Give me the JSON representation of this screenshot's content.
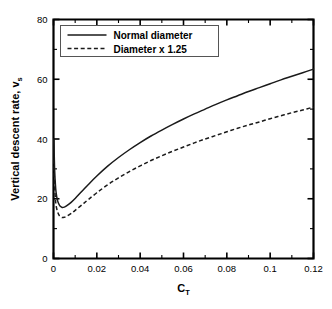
{
  "chart_data": {
    "type": "line",
    "title": "",
    "xlabel": "C_T",
    "xlabel_base": "C",
    "xlabel_sub": "T",
    "ylabel": "Vertical descent rate, v_s",
    "ylabel_base": "Vertical descent rate, v",
    "ylabel_sub": "s",
    "xlim": [
      0,
      0.12
    ],
    "ylim": [
      0,
      80
    ],
    "grid": false,
    "legend_position": "upper-left-inside",
    "x_ticks": [
      {
        "value": 0,
        "label": "0"
      },
      {
        "value": 0.02,
        "label": "0.02"
      },
      {
        "value": 0.04,
        "label": "0.04"
      },
      {
        "value": 0.06,
        "label": "0.06"
      },
      {
        "value": 0.08,
        "label": "0.08"
      },
      {
        "value": 0.1,
        "label": "0.1"
      },
      {
        "value": 0.12,
        "label": "0.12"
      }
    ],
    "x_minor_ticks": [
      0.01,
      0.03,
      0.05,
      0.07,
      0.09,
      0.11
    ],
    "y_ticks": [
      {
        "value": 0,
        "label": "0"
      },
      {
        "value": 20,
        "label": "20"
      },
      {
        "value": 40,
        "label": "40"
      },
      {
        "value": 60,
        "label": "60"
      },
      {
        "value": 80,
        "label": "80"
      }
    ],
    "y_minor_ticks": [
      10,
      30,
      50,
      70
    ],
    "series": [
      {
        "name": "Normal diameter",
        "style": "solid",
        "color": "#1a1a1a",
        "x": [
          0.0002,
          0.0005,
          0.001,
          0.0015,
          0.002,
          0.0025,
          0.003,
          0.004,
          0.005,
          0.006,
          0.008,
          0.01,
          0.013,
          0.016,
          0.02,
          0.025,
          0.03,
          0.035,
          0.04,
          0.045,
          0.05,
          0.055,
          0.06,
          0.065,
          0.07,
          0.075,
          0.08,
          0.085,
          0.09,
          0.095,
          0.1,
          0.105,
          0.11,
          0.115,
          0.12
        ],
        "y": [
          40.0,
          30.0,
          23.5,
          20.6,
          19.1,
          18.2,
          17.6,
          17.1,
          17.2,
          17.6,
          18.7,
          20.1,
          22.4,
          24.7,
          27.6,
          30.9,
          33.8,
          36.4,
          38.8,
          41.0,
          43.0,
          44.9,
          46.7,
          48.4,
          50.0,
          51.6,
          53.1,
          54.5,
          55.9,
          57.2,
          58.5,
          59.8,
          61.0,
          62.2,
          63.4
        ]
      },
      {
        "name": "Diameter x 1.25",
        "style": "dashed",
        "color": "#1a1a1a",
        "x": [
          0.0002,
          0.0005,
          0.001,
          0.0015,
          0.002,
          0.0025,
          0.003,
          0.004,
          0.005,
          0.006,
          0.008,
          0.01,
          0.013,
          0.016,
          0.02,
          0.025,
          0.03,
          0.035,
          0.04,
          0.045,
          0.05,
          0.055,
          0.06,
          0.065,
          0.07,
          0.075,
          0.08,
          0.085,
          0.09,
          0.095,
          0.1,
          0.105,
          0.11,
          0.115,
          0.12
        ],
        "y": [
          33.0,
          24.5,
          19.0,
          16.6,
          15.4,
          14.6,
          14.1,
          13.7,
          13.8,
          14.1,
          15.0,
          16.1,
          17.9,
          19.7,
          22.0,
          24.7,
          27.0,
          29.1,
          31.0,
          32.8,
          34.4,
          35.9,
          37.3,
          38.7,
          40.0,
          41.2,
          42.4,
          43.6,
          44.7,
          45.7,
          46.8,
          47.8,
          48.8,
          49.7,
          50.7
        ]
      }
    ],
    "legend": [
      {
        "label": "Normal diameter",
        "style": "solid"
      },
      {
        "label": "Diameter x 1.25",
        "style": "dashed"
      }
    ]
  }
}
